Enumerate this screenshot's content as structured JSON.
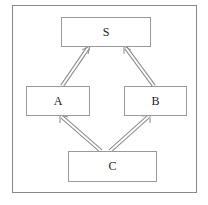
{
  "diagram": {
    "nodes": [
      {
        "id": "S",
        "label": "S"
      },
      {
        "id": "A",
        "label": "A"
      },
      {
        "id": "B",
        "label": "B"
      },
      {
        "id": "C",
        "label": "C"
      }
    ],
    "edges": [
      {
        "from": "A",
        "to": "S",
        "style": "double-line-arrow"
      },
      {
        "from": "B",
        "to": "S",
        "style": "double-line-arrow"
      },
      {
        "from": "C",
        "to": "A",
        "style": "double-line-arrow"
      },
      {
        "from": "C",
        "to": "B",
        "style": "double-line-arrow"
      }
    ]
  }
}
